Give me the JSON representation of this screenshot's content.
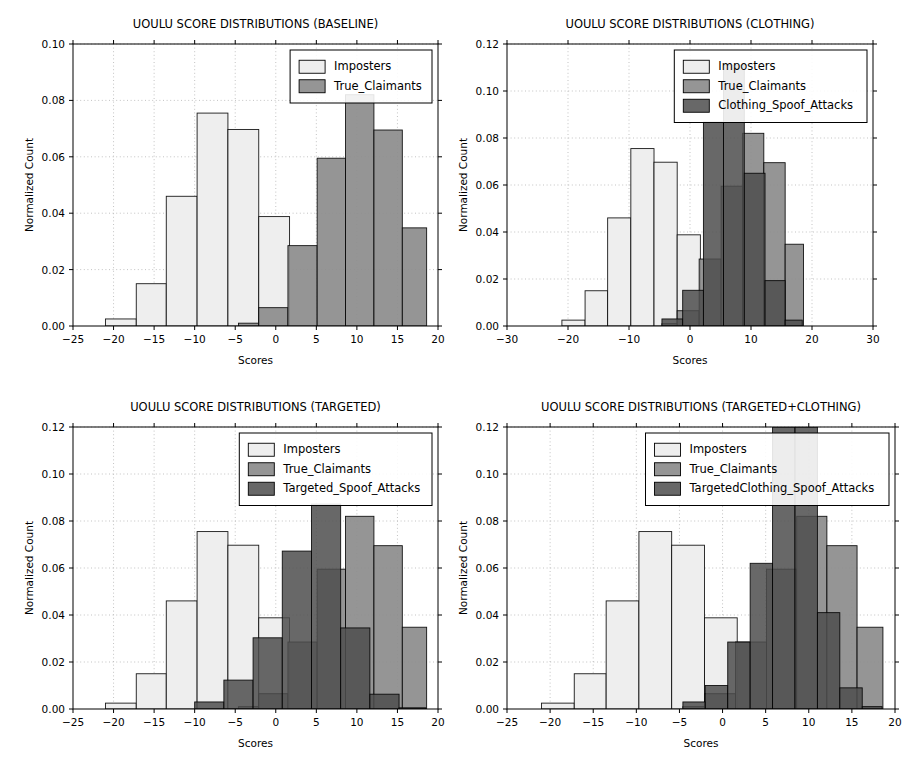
{
  "figure": {
    "width": 915,
    "height": 767,
    "background": "#ffffff"
  },
  "style": {
    "imposters_color": "#eeeeee",
    "true_claimants_color": "#8c8c8c",
    "spoof_color": "#4d4d4d",
    "edge_color": "#000000",
    "grid_color": "#b4b4b4",
    "axis_color": "#000000"
  },
  "chart_data": [
    {
      "id": "baseline",
      "type": "bar",
      "title": "UOULU SCORE DISTRIBUTIONS (BASELINE)",
      "xlabel": "Scores",
      "ylabel": "Normalized Count",
      "xlim": [
        -25,
        20
      ],
      "ylim": [
        0.0,
        0.1
      ],
      "xticks": [
        -25,
        -20,
        -15,
        -10,
        -5,
        0,
        5,
        10,
        15,
        20
      ],
      "xtick_labels": [
        "-25",
        "-20",
        "-15",
        "-10",
        "-5",
        "0",
        "5",
        "10",
        "15",
        "20"
      ],
      "yticks": [
        0.0,
        0.02,
        0.04,
        0.06,
        0.08,
        0.1
      ],
      "ytick_labels": [
        "0.00",
        "0.02",
        "0.04",
        "0.06",
        "0.08",
        "0.10"
      ],
      "grid": true,
      "legend_position": "upper right",
      "series": [
        {
          "name": "Imposters",
          "style": "imposters",
          "bin_edges": [
            -21.0,
            -17.2,
            -13.5,
            -9.7,
            -5.9,
            -2.1,
            1.7
          ],
          "values": [
            0.0025,
            0.015,
            0.046,
            0.0755,
            0.0697,
            0.0388
          ]
        },
        {
          "name": "True_Claimants",
          "style": "true_claimants",
          "bin_edges": [
            -4.6,
            -2.1,
            1.5,
            5.1,
            8.6,
            12.1,
            15.6,
            18.6
          ],
          "values": [
            0.001,
            0.0065,
            0.0285,
            0.0595,
            0.082,
            0.0695,
            0.0348
          ]
        }
      ]
    },
    {
      "id": "clothing",
      "type": "bar",
      "title": "UOULU SCORE DISTRIBUTIONS (CLOTHING)",
      "xlabel": "Scores",
      "ylabel": "Normalized Count",
      "xlim": [
        -30,
        30
      ],
      "ylim": [
        0.0,
        0.12
      ],
      "xticks": [
        -30,
        -20,
        -10,
        0,
        10,
        20,
        30
      ],
      "xtick_labels": [
        "-30",
        "-20",
        "-10",
        "0",
        "10",
        "20",
        "30"
      ],
      "yticks": [
        0.0,
        0.02,
        0.04,
        0.06,
        0.08,
        0.1,
        0.12
      ],
      "ytick_labels": [
        "0.00",
        "0.02",
        "0.04",
        "0.06",
        "0.08",
        "0.10",
        "0.12"
      ],
      "grid": true,
      "legend_position": "upper right",
      "series": [
        {
          "name": "Imposters",
          "style": "imposters",
          "bin_edges": [
            -21.0,
            -17.2,
            -13.5,
            -9.7,
            -5.9,
            -2.1,
            1.7
          ],
          "values": [
            0.0025,
            0.015,
            0.046,
            0.0755,
            0.0697,
            0.0388
          ]
        },
        {
          "name": "True_Claimants",
          "style": "true_claimants",
          "bin_edges": [
            -4.6,
            -2.1,
            1.5,
            5.1,
            8.6,
            12.1,
            15.6,
            18.6
          ],
          "values": [
            0.001,
            0.0065,
            0.0285,
            0.0595,
            0.082,
            0.0695,
            0.0348
          ]
        },
        {
          "name": "Clothing_Spoof_Attacks",
          "style": "spoof",
          "bin_edges": [
            -4.6,
            -1.2,
            2.2,
            5.5,
            8.9,
            12.3,
            15.6,
            18.4
          ],
          "values": [
            0.003,
            0.0152,
            0.0868,
            0.111,
            0.065,
            0.0193,
            0.0025
          ]
        }
      ]
    },
    {
      "id": "targeted",
      "type": "bar",
      "title": "UOULU SCORE DISTRIBUTIONS (TARGETED)",
      "xlabel": "Scores",
      "ylabel": "Normalized Count",
      "xlim": [
        -25,
        20
      ],
      "ylim": [
        0.0,
        0.12
      ],
      "xticks": [
        -25,
        -20,
        -15,
        -10,
        -5,
        0,
        5,
        10,
        15,
        20
      ],
      "xtick_labels": [
        "-25",
        "-20",
        "-15",
        "-10",
        "-5",
        "0",
        "5",
        "10",
        "15",
        "20"
      ],
      "yticks": [
        0.0,
        0.02,
        0.04,
        0.06,
        0.08,
        0.1,
        0.12
      ],
      "ytick_labels": [
        "0.00",
        "0.02",
        "0.04",
        "0.06",
        "0.08",
        "0.10",
        "0.12"
      ],
      "grid": true,
      "legend_position": "upper right",
      "series": [
        {
          "name": "Imposters",
          "style": "imposters",
          "bin_edges": [
            -21.0,
            -17.2,
            -13.5,
            -9.7,
            -5.9,
            -2.1,
            1.7
          ],
          "values": [
            0.0025,
            0.015,
            0.046,
            0.0755,
            0.0697,
            0.0388
          ]
        },
        {
          "name": "True_Claimants",
          "style": "true_claimants",
          "bin_edges": [
            -4.6,
            -2.1,
            1.5,
            5.1,
            8.6,
            12.1,
            15.6,
            18.6
          ],
          "values": [
            0.001,
            0.0065,
            0.0285,
            0.0595,
            0.082,
            0.0695,
            0.0348
          ]
        },
        {
          "name": "Targeted_Spoof_Attacks",
          "style": "spoof",
          "bin_edges": [
            -10.0,
            -6.4,
            -2.8,
            0.8,
            4.4,
            8.0,
            11.6,
            15.2,
            18.5
          ],
          "values": [
            0.003,
            0.0123,
            0.0303,
            0.0672,
            0.0872,
            0.0345,
            0.0063,
            0.0005
          ]
        }
      ]
    },
    {
      "id": "targeted_clothing",
      "type": "bar",
      "title": "UOULU SCORE DISTRIBUTIONS (TARGETED+CLOTHING)",
      "xlabel": "Scores",
      "ylabel": "Normalized Count",
      "xlim": [
        -25,
        20
      ],
      "ylim": [
        0.0,
        0.12
      ],
      "xticks": [
        -25,
        -20,
        -15,
        -10,
        -5,
        0,
        5,
        10,
        15,
        20
      ],
      "xtick_labels": [
        "-25",
        "-20",
        "-15",
        "-10",
        "-5",
        "0",
        "5",
        "10",
        "15",
        "20"
      ],
      "yticks": [
        0.0,
        0.02,
        0.04,
        0.06,
        0.08,
        0.1,
        0.12
      ],
      "ytick_labels": [
        "0.00",
        "0.02",
        "0.04",
        "0.06",
        "0.08",
        "0.10",
        "0.12"
      ],
      "grid": true,
      "legend_position": "upper right",
      "series": [
        {
          "name": "Imposters",
          "style": "imposters",
          "bin_edges": [
            -21.0,
            -17.2,
            -13.5,
            -9.7,
            -5.9,
            -2.1,
            1.7
          ],
          "values": [
            0.0025,
            0.015,
            0.046,
            0.0755,
            0.0697,
            0.0388
          ]
        },
        {
          "name": "True_Claimants",
          "style": "true_claimants",
          "bin_edges": [
            -4.6,
            -2.1,
            1.5,
            5.1,
            8.6,
            12.1,
            15.6,
            18.6
          ],
          "values": [
            0.001,
            0.0065,
            0.0285,
            0.0595,
            0.082,
            0.0695,
            0.0348
          ]
        },
        {
          "name": "TargetedClothing_Spoof_Attacks",
          "style": "spoof",
          "bin_edges": [
            -4.6,
            -2.0,
            0.6,
            3.2,
            5.8,
            8.4,
            11.0,
            13.6,
            16.2,
            18.5
          ],
          "values": [
            0.003,
            0.01,
            0.0285,
            0.062,
            0.123,
            0.129,
            0.041,
            0.009,
            0.001
          ]
        }
      ]
    }
  ]
}
